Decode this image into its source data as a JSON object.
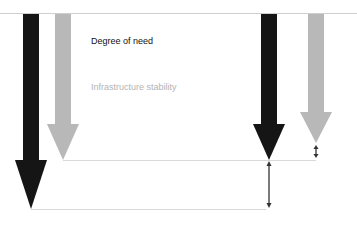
{
  "legend": {
    "need_label": "Degree of need",
    "stability_label": "Infrastructure stability"
  },
  "colors": {
    "need": "#151515",
    "stability": "#b8b8b8",
    "guide_line": "#d9d9d9",
    "measure_arrow": "#333333",
    "baseline": "#cfcfcf"
  },
  "diagram": {
    "left_pair": {
      "need_arrow": {
        "x": 31,
        "tip_y": 209
      },
      "stability_arrow": {
        "x": 63,
        "tip_y": 160
      }
    },
    "right_pair": {
      "need_arrow": {
        "x": 269,
        "tip_y": 160
      },
      "stability_arrow": {
        "x": 316,
        "tip_y": 143
      }
    },
    "gap_indicators": [
      {
        "name": "large-gap",
        "x": 269,
        "from_y": 161,
        "to_y": 208
      },
      {
        "name": "small-gap",
        "x": 316,
        "from_y": 145,
        "to_y": 158
      }
    ]
  }
}
